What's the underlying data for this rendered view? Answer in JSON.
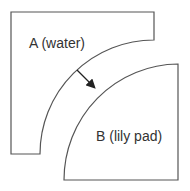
{
  "diagram": {
    "regions": [
      {
        "id": "A",
        "label": "A (water)"
      },
      {
        "id": "B",
        "label": "B (lily pad)"
      }
    ],
    "arrow": {
      "from": "A",
      "to": "B",
      "description": "normal vector pointing from A boundary toward B"
    },
    "colors": {
      "stroke": "#555555",
      "text": "#333333",
      "arrow": "#222222",
      "background": "#ffffff"
    }
  }
}
